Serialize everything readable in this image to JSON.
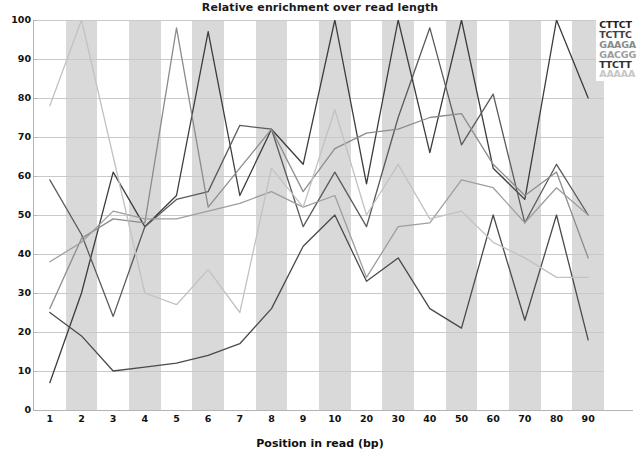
{
  "chart_data": {
    "type": "line",
    "title": "Relative enrichment over read length",
    "xlabel": "Position in read (bp)",
    "ylabel": "",
    "ylim": [
      0,
      100
    ],
    "yticks": [
      0,
      10,
      20,
      30,
      40,
      50,
      60,
      70,
      80,
      90,
      100
    ],
    "grid": true,
    "legend_position": "top-right",
    "categories": [
      "1",
      "2",
      "3",
      "4",
      "5",
      "6",
      "7",
      "8",
      "9",
      "10",
      "20",
      "30",
      "40",
      "50",
      "60",
      "70",
      "80",
      "90"
    ],
    "series": [
      {
        "name": "CTTCT",
        "color": "#3c3c3c",
        "values": [
          7,
          30,
          61,
          47,
          55,
          97,
          55,
          72,
          63,
          100,
          58,
          100,
          66,
          100,
          62,
          54,
          100,
          80
        ]
      },
      {
        "name": "TCTTC",
        "color": "#5a5a5a",
        "values": [
          59,
          45,
          24,
          47,
          54,
          56,
          73,
          72,
          47,
          61,
          47,
          75,
          98,
          68,
          81,
          48,
          63,
          50
        ]
      },
      {
        "name": "GAAGA",
        "color": "#8c8c8c",
        "values": [
          26,
          44,
          49,
          48,
          98,
          52,
          62,
          72,
          56,
          67,
          71,
          72,
          75,
          76,
          63,
          55,
          61,
          39
        ]
      },
      {
        "name": "GACGG",
        "color": "#9e9e9e",
        "values": [
          38,
          43,
          51,
          49,
          49,
          51,
          53,
          56,
          52,
          55,
          34,
          47,
          48,
          59,
          57,
          48,
          57,
          50
        ]
      },
      {
        "name": "TTCTT",
        "color": "#4a4a4a",
        "values": [
          25,
          19,
          10,
          11,
          12,
          14,
          17,
          26,
          42,
          50,
          33,
          39,
          26,
          21,
          50,
          23,
          50,
          18
        ]
      },
      {
        "name": "AAAAA",
        "color": "#c2c2c2",
        "values": [
          78,
          100,
          65,
          30,
          27,
          36,
          25,
          62,
          52,
          77,
          50,
          63,
          49,
          51,
          43,
          39,
          34,
          34
        ]
      }
    ]
  },
  "legend": {
    "items": [
      {
        "label": "CTTCT",
        "color": "#1d1d1d"
      },
      {
        "label": "TCTTC",
        "color": "#3f3f3f"
      },
      {
        "label": "GAAGA",
        "color": "#8a8a8a"
      },
      {
        "label": "GACGG",
        "color": "#9c9c9c"
      },
      {
        "label": "TTCTT",
        "color": "#2e2e2e"
      },
      {
        "label": "AAAAA",
        "color": "#c6c6c6"
      }
    ]
  },
  "axes": {
    "band_color": "#d9d9d9",
    "grid_color": "#c9c9c9",
    "axis_color": "#b4b4b4"
  }
}
